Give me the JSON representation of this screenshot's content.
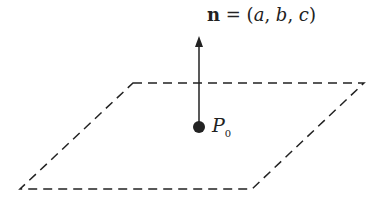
{
  "diagram": {
    "normal_label": {
      "vector": "n",
      "equals": " = (",
      "a": "a",
      "sep1": ", ",
      "b": "b",
      "sep2": ", ",
      "c": "c",
      "close": ")"
    },
    "point_label": {
      "name": "P",
      "subscript": "0"
    },
    "plane": {
      "style": "dashed",
      "corners": [
        [
          133,
          83
        ],
        [
          364,
          83
        ],
        [
          252,
          189
        ],
        [
          20,
          189
        ]
      ]
    },
    "colors": {
      "line": "#222222",
      "background": "#ffffff"
    }
  }
}
